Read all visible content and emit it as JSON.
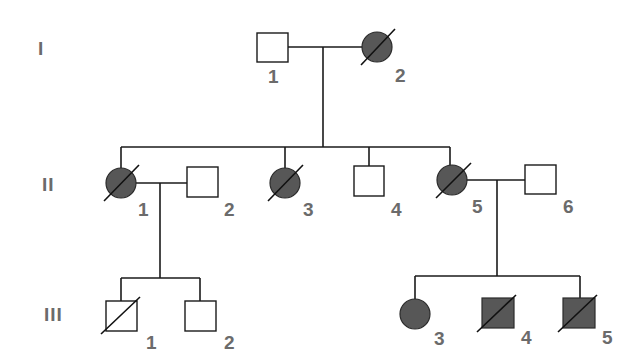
{
  "diagram": {
    "type": "pedigree",
    "colors": {
      "affected_fill": "#575757",
      "unaffected_fill": "#ffffff",
      "line": "#1a1a1a",
      "label": "#6b6b6b"
    },
    "generations": [
      {
        "label": "I",
        "y": 47
      },
      {
        "label": "II",
        "y": 183
      },
      {
        "label": "III",
        "y": 314
      }
    ],
    "individuals": [
      {
        "id": "I-1",
        "generation": "I",
        "number": "1",
        "sex": "male",
        "affected": false,
        "deceased": false
      },
      {
        "id": "I-2",
        "generation": "I",
        "number": "2",
        "sex": "female",
        "affected": true,
        "deceased": true
      },
      {
        "id": "II-1",
        "generation": "II",
        "number": "1",
        "sex": "female",
        "affected": true,
        "deceased": true
      },
      {
        "id": "II-2",
        "generation": "II",
        "number": "2",
        "sex": "male",
        "affected": false,
        "deceased": false
      },
      {
        "id": "II-3",
        "generation": "II",
        "number": "3",
        "sex": "female",
        "affected": true,
        "deceased": true
      },
      {
        "id": "II-4",
        "generation": "II",
        "number": "4",
        "sex": "male",
        "affected": false,
        "deceased": false
      },
      {
        "id": "II-5",
        "generation": "II",
        "number": "5",
        "sex": "female",
        "affected": true,
        "deceased": true
      },
      {
        "id": "II-6",
        "generation": "II",
        "number": "6",
        "sex": "male",
        "affected": false,
        "deceased": false
      },
      {
        "id": "III-1",
        "generation": "III",
        "number": "1",
        "sex": "male",
        "affected": false,
        "deceased": true
      },
      {
        "id": "III-2",
        "generation": "III",
        "number": "2",
        "sex": "male",
        "affected": false,
        "deceased": false
      },
      {
        "id": "III-3",
        "generation": "III",
        "number": "3",
        "sex": "female",
        "affected": true,
        "deceased": false
      },
      {
        "id": "III-4",
        "generation": "III",
        "number": "4",
        "sex": "male",
        "affected": true,
        "deceased": true
      },
      {
        "id": "III-5",
        "generation": "III",
        "number": "5",
        "sex": "male",
        "affected": true,
        "deceased": true
      }
    ],
    "matings": [
      {
        "partners": [
          "I-1",
          "I-2"
        ],
        "children": [
          "II-1",
          "II-3",
          "II-4",
          "II-5"
        ]
      },
      {
        "partners": [
          "II-1",
          "II-2"
        ],
        "children": [
          "III-1",
          "III-2"
        ]
      },
      {
        "partners": [
          "II-5",
          "II-6"
        ],
        "children": [
          "III-3",
          "III-4",
          "III-5"
        ]
      }
    ]
  },
  "labels": {
    "gen_I": "I",
    "gen_II": "II",
    "gen_III": "III",
    "I_1": "1",
    "I_2": "2",
    "II_1": "1",
    "II_2": "2",
    "II_3": "3",
    "II_4": "4",
    "II_5": "5",
    "II_6": "6",
    "III_1": "1",
    "III_2": "2",
    "III_3": "3",
    "III_4": "4",
    "III_5": "5"
  }
}
